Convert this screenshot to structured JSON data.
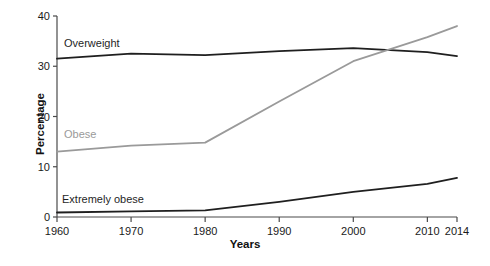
{
  "chart_data": {
    "type": "line",
    "title": "",
    "xlabel": "Years",
    "ylabel": "Percentage",
    "xlim": [
      1960,
      2014
    ],
    "ylim": [
      0,
      40
    ],
    "grid": false,
    "legend": "inline-labels",
    "xticks": [
      1960,
      1970,
      1980,
      1990,
      2000,
      2010,
      2014
    ],
    "xtick_labels": [
      "1960",
      "1970",
      "1980",
      "1990",
      "2000",
      "2010",
      "2014"
    ],
    "yticks": [
      0,
      10,
      20,
      30,
      40
    ],
    "ytick_labels": [
      "0",
      "10",
      "20",
      "30",
      "40"
    ],
    "x": [
      1960,
      1970,
      1980,
      1990,
      2000,
      2010,
      2014
    ],
    "series": [
      {
        "name": "Overweight",
        "color": "#1f1f1f",
        "values": [
          31.5,
          32.5,
          32.2,
          33.0,
          33.6,
          32.8,
          32.0
        ]
      },
      {
        "name": "Obese",
        "color": "#9a9a9a",
        "values": [
          13.0,
          14.2,
          14.8,
          23.0,
          31.0,
          35.8,
          38.0
        ]
      },
      {
        "name": "Extremely obese",
        "color": "#1f1f1f",
        "values": [
          0.9,
          1.1,
          1.3,
          3.0,
          5.0,
          6.6,
          7.8
        ]
      }
    ],
    "annotations": [
      {
        "text": "Overweight",
        "series": "Overweight"
      },
      {
        "text": "Obese",
        "series": "Obese"
      },
      {
        "text": "Extremely obese",
        "series": "Extremely obese"
      }
    ],
    "colors": {
      "axis": "#4a4a4a",
      "overweight": "#1f1f1f",
      "obese": "#9a9a9a",
      "extremely_obese": "#1f1f1f",
      "background": "#ffffff"
    }
  }
}
